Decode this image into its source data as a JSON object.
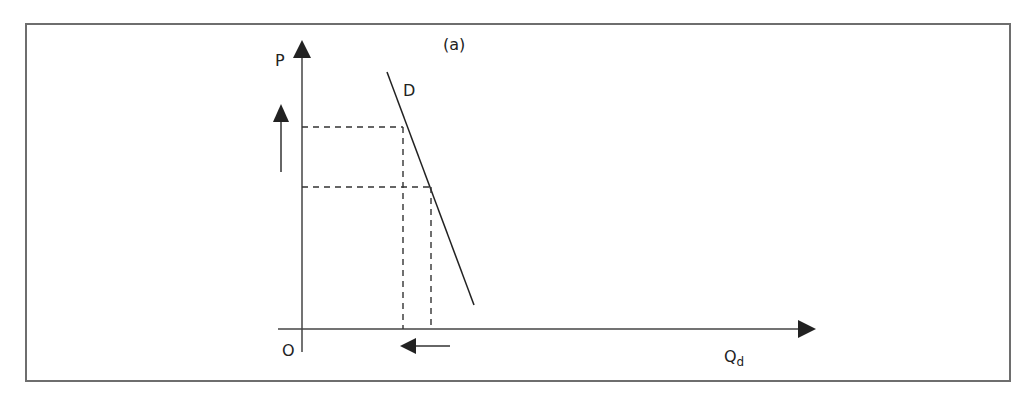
{
  "diagram": {
    "panel_label": "(a)",
    "y_axis_label": "P",
    "x_axis_label": "Q",
    "x_axis_subscript": "d",
    "origin_label": "O",
    "curve_label": "D",
    "colors": {
      "line": "#222222",
      "frame": "#6e6e6e",
      "background": "#ffffff"
    }
  }
}
